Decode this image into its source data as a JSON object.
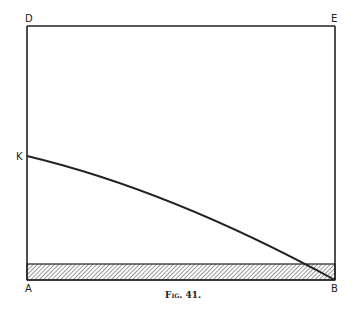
{
  "figure": {
    "caption": "Fig. 41.",
    "points": {
      "D": "D",
      "E": "E",
      "K": "K",
      "A": "A",
      "B": "B"
    },
    "colors": {
      "ink": "#222222",
      "background": "#ffffff"
    },
    "shapes": {
      "rectangle": "DEBA",
      "curve": "K to B",
      "hatched_band": "base strip along AB"
    }
  }
}
